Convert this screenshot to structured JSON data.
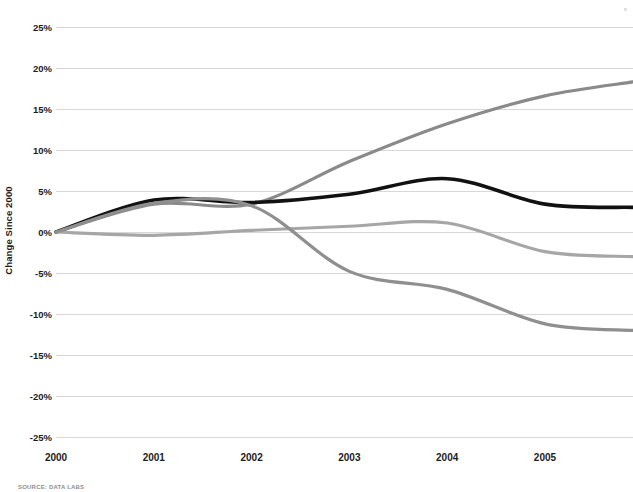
{
  "chart_data": {
    "type": "line",
    "title": "",
    "subtitle": "",
    "xlabel": "",
    "ylabel": "Change Since 2000",
    "x": [
      2000,
      2001,
      2002,
      2003,
      2004,
      2005,
      2005.9
    ],
    "xlim": [
      2000,
      2005.9
    ],
    "ylim": [
      -25,
      25
    ],
    "ytick_labels": [
      "25%",
      "20%",
      "15%",
      "10%",
      "5%",
      "0%",
      "-5%",
      "-10%",
      "-15%",
      "-20%",
      "-25%"
    ],
    "ytick_values": [
      25,
      20,
      15,
      10,
      5,
      0,
      -5,
      -10,
      -15,
      -20,
      -25
    ],
    "xtick_labels": [
      "2000",
      "2001",
      "2002",
      "2003",
      "2004",
      "2005"
    ],
    "xtick_values": [
      2000,
      2001,
      2002,
      2003,
      2004,
      2005
    ],
    "grid": "horizontal",
    "legend": "none",
    "series": [
      {
        "name": "series-rising",
        "color": "#8a8a8a",
        "width": 3.2,
        "values": [
          0,
          3.4,
          3.4,
          8.6,
          13.2,
          16.6,
          18.3
        ]
      },
      {
        "name": "series-black",
        "color": "#111111",
        "width": 3.6,
        "values": [
          0,
          3.9,
          3.6,
          4.6,
          6.5,
          3.4,
          3.0
        ]
      },
      {
        "name": "series-mid-gray",
        "color": "#a6a6a6",
        "width": 3.2,
        "values": [
          0,
          -0.4,
          0.2,
          0.7,
          1.1,
          -2.4,
          -3.0
        ]
      },
      {
        "name": "series-declining",
        "color": "#8f8f8f",
        "width": 3.2,
        "values": [
          0,
          3.5,
          3.2,
          -4.8,
          -7.0,
          -11.2,
          -12.0
        ]
      }
    ],
    "source_note": "SOURCE: DATA LABS"
  },
  "axis": {
    "y_title": "Change Since 2000"
  }
}
